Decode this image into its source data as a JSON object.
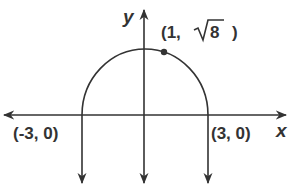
{
  "diagram": {
    "axes": {
      "x_label": "x",
      "y_label": "y"
    },
    "curve": "upper semicircle of radius 3 centered at origin",
    "points": [
      {
        "label": "(-3, 0)",
        "x": -3,
        "y": 0
      },
      {
        "label": "(3, 0)",
        "x": 3,
        "y": 0
      },
      {
        "label_prefix": "(1, ",
        "label_root": "8",
        "label_suffix": ")",
        "x": 1,
        "y": "√8",
        "marked": true
      }
    ],
    "vertical_test_lines_x": [
      -3,
      0,
      3
    ],
    "colors": {
      "stroke": "#333333",
      "background": "#ffffff"
    }
  }
}
